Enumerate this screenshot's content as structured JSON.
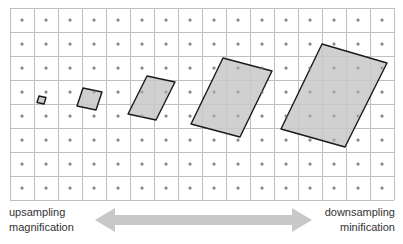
{
  "grid": {
    "x0": 10,
    "y0": 8,
    "cell": 24,
    "cols": 16,
    "rows": 8,
    "line_color": "#bfbfbf",
    "dot_color": "#8c8c8c",
    "dot_radius": 1.5
  },
  "footprints": {
    "fill": "#c8c8c8",
    "stroke": "#1a1a1a",
    "items": [
      {
        "name": "footprint-1",
        "points": "39,96 46,97.5 44,104 37,102.5"
      },
      {
        "name": "footprint-2",
        "points": "83,88 102,92 96,110 77,106"
      },
      {
        "name": "footprint-3",
        "points": "147,76 175,82 156,120 128,114"
      },
      {
        "name": "footprint-4",
        "points": "223,58 272,71 240,137 191,124"
      },
      {
        "name": "footprint-5",
        "points": "322,44 387,63 345,147 281,129"
      }
    ]
  },
  "arrow": {
    "color": "#c8c8c8",
    "x_start": 95,
    "x_end": 312,
    "y": 220
  },
  "labels": {
    "left_line1": "upsampling",
    "left_line2": "magnification",
    "right_line1": "downsampling",
    "right_line2": "minification"
  }
}
